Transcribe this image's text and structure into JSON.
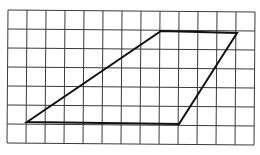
{
  "figure": {
    "type": "grid-quadrilateral",
    "grid": {
      "columns": 13,
      "rows": 7,
      "origin_px": [
        8,
        10
      ],
      "cell_px": 19,
      "line_color": "#3a3a3a",
      "line_width": 1
    },
    "shape": {
      "name": "trapezoid",
      "stroke_color": "#111111",
      "stroke_width": 2,
      "vertices_grid": [
        [
          1,
          6
        ],
        [
          8,
          1
        ],
        [
          12,
          1
        ],
        [
          9,
          6
        ]
      ],
      "vertices_px": [
        [
          27,
          122
        ],
        [
          161,
          31
        ],
        [
          237,
          33
        ],
        [
          179,
          124
        ]
      ]
    },
    "background": "#ffffff"
  }
}
